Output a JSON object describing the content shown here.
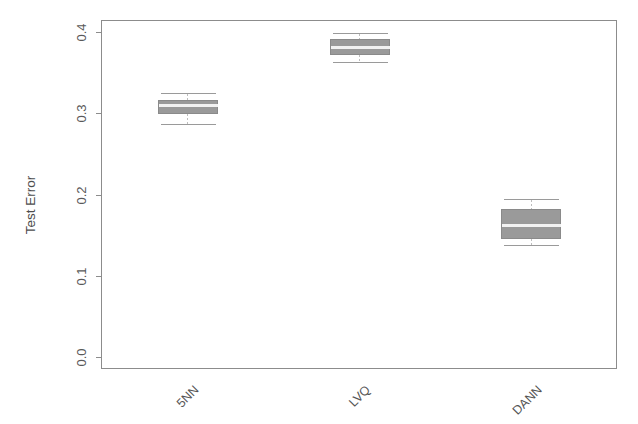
{
  "chart_data": {
    "type": "box",
    "title": "",
    "xlabel": "",
    "ylabel": "Test Error",
    "ylim": [
      0.0,
      0.4
    ],
    "grid": false,
    "legend": null,
    "categories": [
      "5NN",
      "LVQ",
      "DANN"
    ],
    "ytick_labels": [
      "0.0",
      "0.1",
      "0.2",
      "0.3",
      "0.4"
    ],
    "ytick_values": [
      0.0,
      0.1,
      0.2,
      0.3,
      0.4
    ],
    "boxes": [
      {
        "label": "5NN",
        "whisker_low": 0.287,
        "q1": 0.3,
        "median": 0.31,
        "q3": 0.316,
        "whisker_high": 0.325,
        "outliers": []
      },
      {
        "label": "LVQ",
        "whisker_low": 0.363,
        "q1": 0.373,
        "median": 0.382,
        "q3": 0.391,
        "whisker_high": 0.399,
        "outliers": []
      },
      {
        "label": "DANN",
        "whisker_low": 0.138,
        "q1": 0.146,
        "median": 0.162,
        "q3": 0.182,
        "whisker_high": 0.194,
        "outliers": []
      }
    ],
    "colors": {
      "box_fill": "#9a9a9a",
      "box_stroke": "#8a8a8a",
      "median": "#f2f2f2",
      "whisker": "#bdbdbd",
      "axis": "#8c8c8c",
      "text": "#555555",
      "background": "#ffffff"
    }
  },
  "axis": {
    "y_title": "Test Error"
  }
}
